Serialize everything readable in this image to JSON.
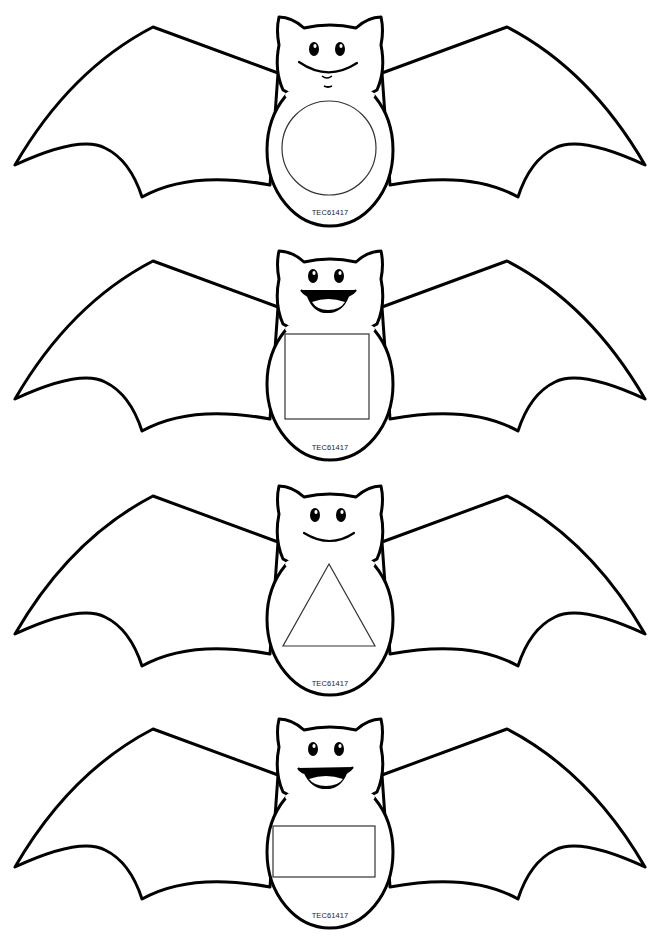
{
  "page": {
    "background": "#ffffff",
    "line_color": "#000000"
  },
  "bats": [
    {
      "shape": "circle",
      "face": "smile",
      "code": "TEC61417",
      "top": 12
    },
    {
      "shape": "square",
      "face": "open-smile",
      "code": "TEC61417",
      "top": 246
    },
    {
      "shape": "triangle",
      "face": "smile",
      "code": "TEC61417",
      "top": 481
    },
    {
      "shape": "rectangle",
      "face": "open-smile",
      "code": "TEC61417",
      "top": 714
    }
  ]
}
